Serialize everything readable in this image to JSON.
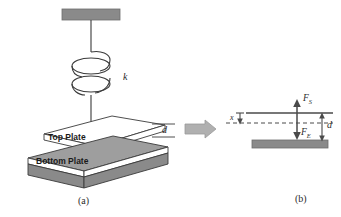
{
  "figure": {
    "type": "physics-schematic",
    "panels": [
      {
        "id": "a",
        "caption": "(a)",
        "labels": {
          "spring_constant": "k",
          "top_plate": "Top Plate",
          "bottom_plate": "Bottom Plate",
          "gap": "d"
        }
      },
      {
        "id": "b",
        "caption": "(b)",
        "labels": {
          "spring_force": "F",
          "spring_force_sub": "S",
          "electrostatic_force": "F",
          "electrostatic_force_sub": "E",
          "displacement": "x",
          "gap": "d"
        }
      }
    ],
    "transition_arrow": "right-arrow"
  },
  "colors": {
    "plate_fill_gray": "#8a8a8a",
    "plate_fill_light": "#ffffff",
    "plate_fill_mid": "#b3b3b3",
    "outline": "#3a3a3a",
    "arrow_gray": "#a6a6a6",
    "text": "#2b2b2b",
    "background": "#ffffff"
  }
}
